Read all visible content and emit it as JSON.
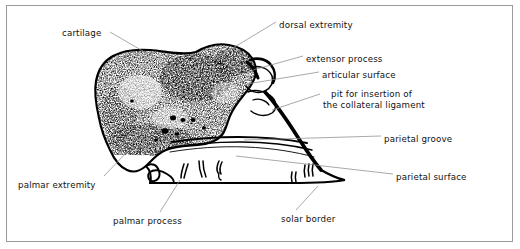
{
  "figure": {
    "border_color": "#9a9a9a",
    "ink_color": "#000000",
    "leader_color": "#8c8c8c",
    "background": "#ffffff"
  },
  "labels": [
    {
      "id": "cartilage",
      "text": "cartilage",
      "x": 62,
      "y": 28,
      "align": "left"
    },
    {
      "id": "dorsal-extremity",
      "text": "dorsal extremity",
      "x": 279,
      "y": 20,
      "align": "left"
    },
    {
      "id": "extensor-process",
      "text": "extensor process",
      "x": 306,
      "y": 54,
      "align": "left"
    },
    {
      "id": "articular-surface",
      "text": "articular surface",
      "x": 322,
      "y": 70,
      "align": "left"
    },
    {
      "id": "pit-collateral-line1",
      "text": "pit for insertion of",
      "x": 331,
      "y": 89,
      "align": "left"
    },
    {
      "id": "pit-collateral-line2",
      "text": "the collateral ligament",
      "x": 323,
      "y": 100,
      "align": "left"
    },
    {
      "id": "parietal-groove",
      "text": "parietal groove",
      "x": 384,
      "y": 134,
      "align": "left"
    },
    {
      "id": "parietal-surface",
      "text": "parietal surface",
      "x": 396,
      "y": 172,
      "align": "left"
    },
    {
      "id": "palmar-extremity",
      "text": "palmar extremity",
      "x": 18,
      "y": 180,
      "align": "left"
    },
    {
      "id": "palmar-process",
      "text": "palmar process",
      "x": 113,
      "y": 216,
      "align": "left"
    },
    {
      "id": "solar-border",
      "text": "solar border",
      "x": 281,
      "y": 214,
      "align": "left"
    }
  ],
  "leader_lines": [
    {
      "id": "leader-cartilage",
      "from": [
        110,
        32
      ],
      "to": [
        196,
        82
      ]
    },
    {
      "id": "leader-dorsal-extremity",
      "from": [
        276,
        22
      ],
      "to": [
        213,
        60
      ]
    },
    {
      "id": "leader-extensor-process",
      "from": [
        303,
        56
      ],
      "to": [
        253,
        70
      ]
    },
    {
      "id": "leader-articular-surface",
      "from": [
        319,
        72
      ],
      "to": [
        247,
        84
      ]
    },
    {
      "id": "leader-pit-collateral",
      "from": [
        320,
        94
      ],
      "to": [
        272,
        110
      ]
    },
    {
      "id": "leader-parietal-groove",
      "from": [
        381,
        136
      ],
      "to": [
        244,
        140
      ]
    },
    {
      "id": "leader-parietal-surface",
      "from": [
        393,
        174
      ],
      "to": [
        236,
        156
      ]
    },
    {
      "id": "leader-palmar-extremity",
      "from": [
        104,
        176
      ],
      "to": [
        127,
        152
      ]
    },
    {
      "id": "leader-palmar-process",
      "from": [
        160,
        212
      ],
      "to": [
        180,
        180
      ]
    },
    {
      "id": "leader-solar-border",
      "from": [
        296,
        210
      ],
      "to": [
        318,
        186
      ]
    }
  ],
  "anatomy_features": [
    "stippled cancellous bone body",
    "extensor process notch",
    "curved articular surface",
    "parietal groove contour lines",
    "vascular foramina along solar border",
    "palmar process hook"
  ]
}
